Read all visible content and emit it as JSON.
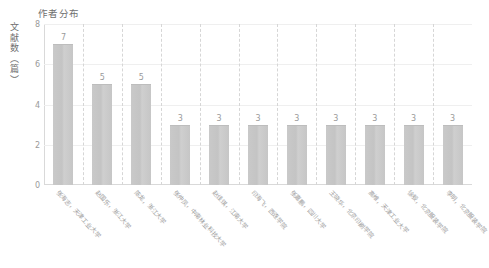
{
  "chart_data": {
    "type": "bar",
    "title": "作者分布",
    "xlabel": "",
    "ylabel": "文献数（篇）",
    "ylim": [
      0,
      8
    ],
    "yticks": [
      0,
      2,
      4,
      6,
      8
    ],
    "grid": "horizontal-faint-and-vertical-dashed-separators",
    "legend": "none",
    "bar_color": "#c8c8c8",
    "categories": [
      "张海志，天津工业大学",
      "赵国乐，浙江大学",
      "陈龙，浙江大学",
      "张仲凤，中南林业科技大学",
      "赵佳琪，江南大学",
      "印海飞，西连学院",
      "张嘉鹏，四川大学",
      "王晓华，北京印刷学院",
      "高维，天津工业大学",
      "徐毅，北京服装学院",
      "李明，北京服装学院"
    ],
    "values": [
      7,
      5,
      5,
      3,
      3,
      3,
      3,
      3,
      3,
      3,
      3
    ]
  },
  "colors": {
    "bar": "#c8c8c8",
    "axis": "#d9d9d9",
    "grid": "#efefef",
    "separator": "#d6d6d6",
    "text": "#9a9a9a",
    "title_text": "#6f6f6f",
    "background": "#ffffff"
  }
}
